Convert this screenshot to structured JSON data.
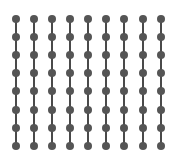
{
  "diagram": {
    "type": "dot-grid",
    "columns": 9,
    "rows": 8,
    "column_x": [
      16,
      34,
      52,
      70,
      88,
      106,
      124,
      143,
      161
    ],
    "row_y": [
      19,
      37,
      55,
      73,
      91,
      110,
      128,
      146
    ],
    "dot_radius": 4,
    "line_width": 2,
    "connections": "vertical",
    "colors": {
      "background": "#ffffff",
      "dot": "#555555",
      "line": "#4a4a4a"
    }
  }
}
